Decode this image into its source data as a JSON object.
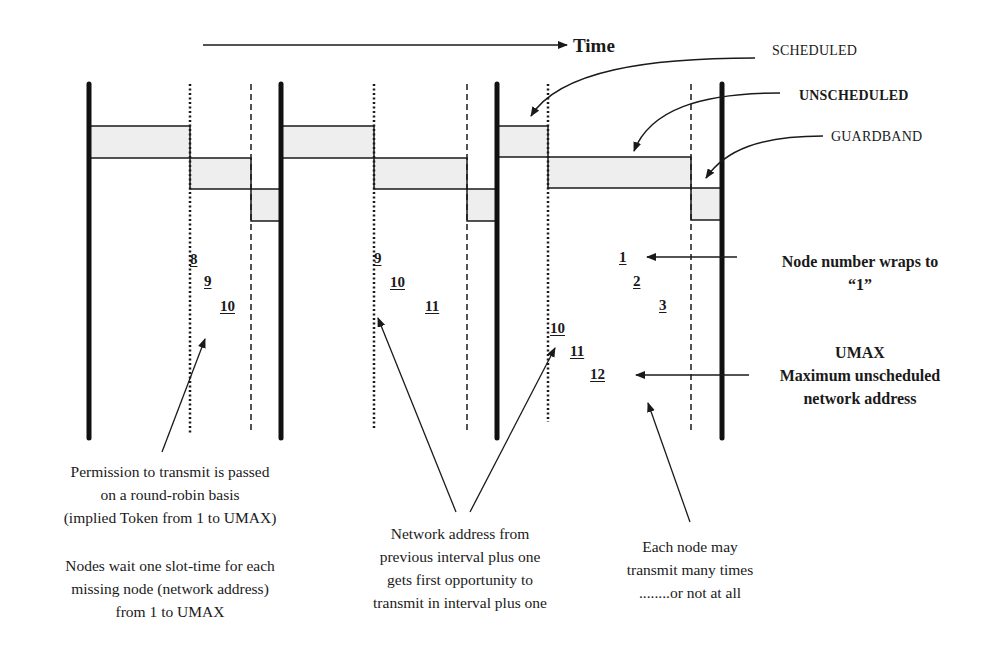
{
  "diagram": {
    "title_arrow_label": "Time",
    "legend": {
      "scheduled": "SCHEDULED",
      "unscheduled": "UNSCHEDULED",
      "guardband": "GUARDBAND"
    },
    "colors": {
      "line": "#1a1a1a",
      "bar_fill": "#eeeeee",
      "background": "#ffffff"
    },
    "intervals": [
      {
        "node_numbers": [
          "8",
          "9",
          "10"
        ]
      },
      {
        "node_numbers": [
          "9",
          "10",
          "11"
        ]
      },
      {
        "node_numbers_upper": [
          "1",
          "2",
          "3"
        ],
        "node_numbers_lower": [
          "10",
          "11",
          "12"
        ]
      }
    ],
    "right_notes": {
      "wrap": {
        "line1": "Node number wraps to",
        "line2": "“1”"
      },
      "umax": {
        "line1": "UMAX",
        "line2": "Maximum unscheduled",
        "line3": "network address"
      }
    },
    "bottom_notes": {
      "round_robin": {
        "line1": "Permission to transmit is passed",
        "line2": "on a round-robin basis",
        "line3": "(implied Token from 1 to UMAX)"
      },
      "wait": {
        "line1": "Nodes wait one slot-time for each",
        "line2": "missing node (network address)",
        "line3": "from 1 to UMAX"
      },
      "first_opportunity": {
        "line1": "Network address from",
        "line2": "previous interval plus one",
        "line3": "gets first opportunity to",
        "line4": "transmit in interval plus one"
      },
      "each_node": {
        "line1": "Each node may",
        "line2": "transmit many times",
        "line3": "........or not at all"
      }
    }
  }
}
